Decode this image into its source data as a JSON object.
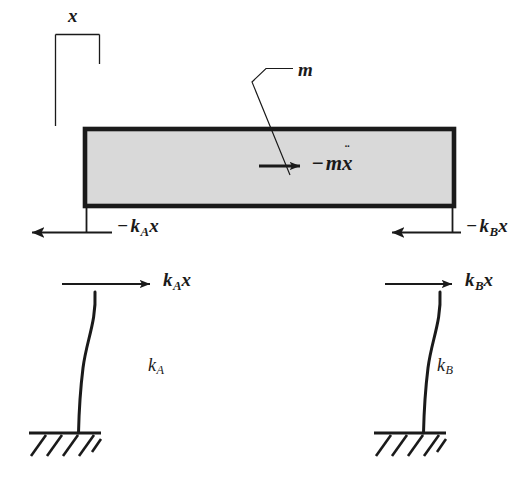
{
  "figure": {
    "type": "free-body-diagram",
    "background_color": "#ffffff",
    "ink_color": "#1a1a1a",
    "mass_fill_color": "#d9d9d9",
    "mass_border_color": "#1a1a1a"
  },
  "labels": {
    "displacement": "x",
    "mass": "m",
    "inertia_force_minus": "−",
    "inertia_force_m": "m",
    "inertia_force_x": "x",
    "inertia_force_dots": "¨",
    "spring_a_name": "k",
    "spring_a_sub": "A",
    "spring_b_name": "k",
    "spring_b_sub": "B",
    "force_var": "x",
    "minus_sign": "−"
  },
  "forces": [
    {
      "id": "reaction-a-on-mass",
      "label_text": "− k_A x",
      "minus": "−",
      "base": "k",
      "sub": "A",
      "var": "x",
      "direction": "left",
      "applied_to": "mass",
      "side": "left"
    },
    {
      "id": "reaction-b-on-mass",
      "label_text": "− k_B x",
      "minus": "−",
      "base": "k",
      "sub": "B",
      "var": "x",
      "direction": "left",
      "applied_to": "mass",
      "side": "right"
    },
    {
      "id": "shear-a-on-column",
      "label_text": "k_A x",
      "minus": "",
      "base": "k",
      "sub": "A",
      "var": "x",
      "direction": "right",
      "applied_to": "column",
      "side": "left"
    },
    {
      "id": "shear-b-on-column",
      "label_text": "k_B x",
      "minus": "",
      "base": "k",
      "sub": "B",
      "var": "x",
      "direction": "right",
      "applied_to": "column",
      "side": "right"
    }
  ],
  "inertia_force": {
    "label_text": "− m ẍ",
    "direction": "right",
    "located_in": "mass-block"
  },
  "columns": [
    {
      "id": "column-a",
      "stiffness_label": "k_A",
      "base": "fixed-hatched-support",
      "side": "left"
    },
    {
      "id": "column-b",
      "stiffness_label": "k_B",
      "base": "fixed-hatched-support",
      "side": "right"
    }
  ]
}
